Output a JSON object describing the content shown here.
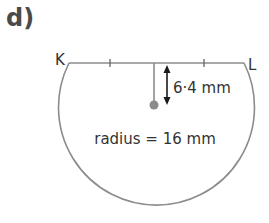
{
  "part_label": "d)",
  "diagram": {
    "type": "circle-segment",
    "points": {
      "left_label": "K",
      "right_label": "L"
    },
    "chord": {
      "name": "KL",
      "tick_marks": 2
    },
    "distance_label": "6·4 mm",
    "radius_label": "radius = 16 mm",
    "values": {
      "radius_mm": 16,
      "chord_to_centre_mm": 6.4
    },
    "colors": {
      "outline": "#8c8c8c",
      "arrow": "#1a1a1a",
      "centre_dot": "#8c8c8c",
      "text": "#333333"
    }
  }
}
